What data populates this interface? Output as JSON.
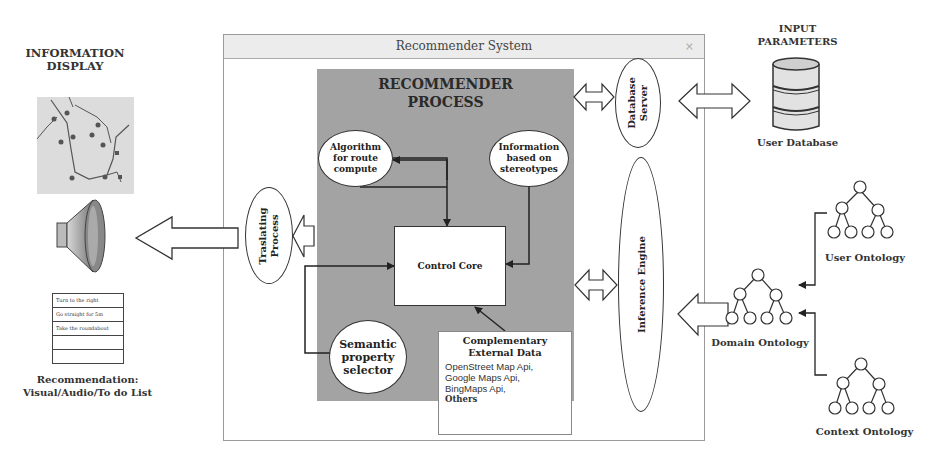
{
  "window": {
    "title": "Recommender System",
    "close_glyph": "×"
  },
  "left": {
    "info_display_title_line1": "INFORMATION",
    "info_display_title_line2": "DISPLAY",
    "map_icon": "map-icon",
    "speaker_icon": "speaker-icon",
    "todo_items": [
      "Turn to the right",
      "Go straight for 5m",
      "Take the roundabout",
      "",
      ""
    ],
    "caption_line1": "Recommendation:",
    "caption_line2": "Visual/Audio/To do List"
  },
  "process": {
    "title_line1": "RECOMMENDER",
    "title_line2": "PROCESS",
    "algorithm": [
      "Algorithm",
      "for route",
      "compute"
    ],
    "stereotypes": [
      "Information",
      "based on",
      "stereotypes"
    ],
    "control_core": "Control Core",
    "semantic": [
      "Semantic",
      "property",
      "selector"
    ],
    "external": {
      "title_line1": "Complementary",
      "title_line2": "External Data",
      "items": [
        "OpenStreet Map Api,",
        "Google Maps Api,",
        "BingMaps Api,"
      ],
      "last": "Others"
    }
  },
  "translating": [
    "Traslating",
    "Process"
  ],
  "database_server": [
    "Database",
    "Server"
  ],
  "inference_engine": "Inference Engine",
  "right": {
    "input_title_line1": "INPUT",
    "input_title_line2": "PARAMETERS",
    "user_database": "User Database",
    "user_ontology": "User Ontology",
    "domain_ontology": "Domain Ontology",
    "context_ontology": "Context Ontology"
  },
  "colors": {
    "process_bg": "#a3a3a3",
    "titlebar_bg": "#ececec",
    "stroke": "#333333"
  }
}
